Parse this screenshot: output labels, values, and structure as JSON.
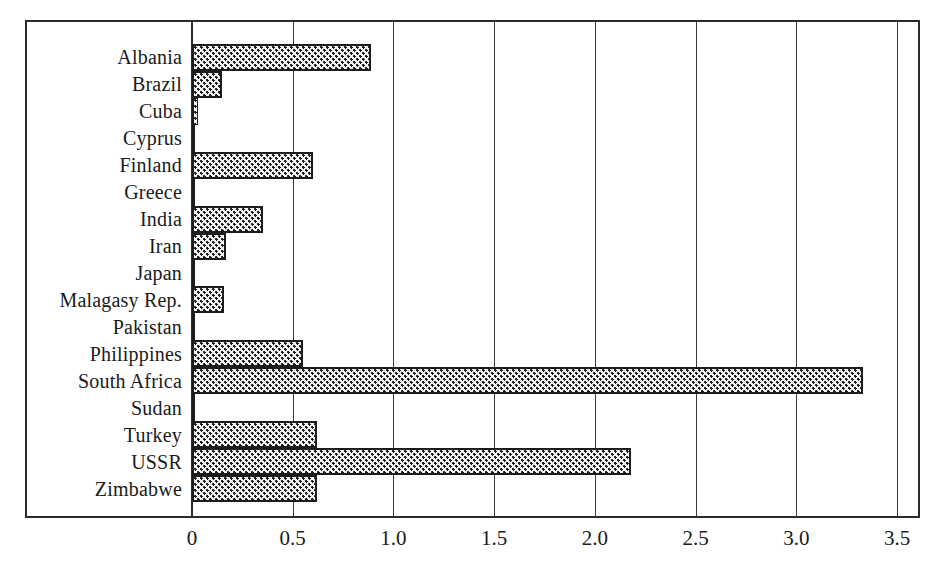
{
  "chart_data": {
    "type": "bar",
    "orientation": "horizontal",
    "title": "",
    "subtitle": "",
    "xlabel": "",
    "ylabel": "",
    "xlim": [
      0,
      3.5
    ],
    "xticks": [
      0,
      0.5,
      1.0,
      1.5,
      2.0,
      2.5,
      3.0,
      3.5
    ],
    "xtick_labels": [
      "0",
      "0.5",
      "1.0",
      "1.5",
      "2.0",
      "2.5",
      "3.0",
      "3.5"
    ],
    "grid": true,
    "grid_axis": "x",
    "legend": false,
    "legend_position": "none",
    "bar_fill": "checkered-halftone-dots",
    "bar_edge_color": "#1c1c1c",
    "bar_face_color": "#f2f2f2",
    "frame_color": "#2b2b2b",
    "categories": [
      "Albania",
      "Brazil",
      "Cuba",
      "Cyprus",
      "Finland",
      "Greece",
      "India",
      "Iran",
      "Japan",
      "Malagasy Rep.",
      "Pakistan",
      "Philippines",
      "South Africa",
      "Sudan",
      "Turkey",
      "USSR",
      "Zimbabwe"
    ],
    "values": [
      0.89,
      0.15,
      0.03,
      0.005,
      0.6,
      0.01,
      0.35,
      0.17,
      0.01,
      0.16,
      0.005,
      0.55,
      3.33,
      0.01,
      0.62,
      2.18,
      0.62
    ]
  }
}
